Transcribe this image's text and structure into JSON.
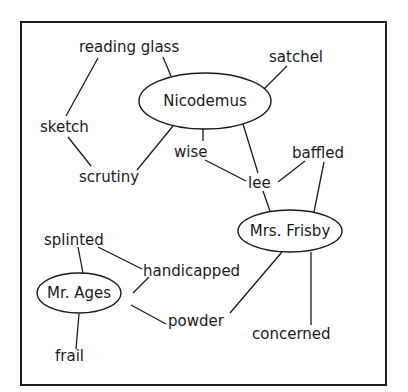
{
  "diagram": {
    "type": "character-word-web",
    "characters": [
      {
        "id": "nicodemus",
        "label": "Nicodemus",
        "cx": 205,
        "cy": 101,
        "rx": 66,
        "ry": 28
      },
      {
        "id": "mrs-frisby",
        "label": "Mrs. Frisby",
        "cx": 290,
        "cy": 231,
        "rx": 52,
        "ry": 21
      },
      {
        "id": "mr-ages",
        "label": "Mr. Ages",
        "cx": 79,
        "cy": 293,
        "rx": 42,
        "ry": 20
      }
    ],
    "words": [
      {
        "id": "reading-glass",
        "label": "reading glass",
        "x": 79,
        "y": 52
      },
      {
        "id": "satchel",
        "label": "satchel",
        "x": 269,
        "y": 62
      },
      {
        "id": "sketch",
        "label": "sketch",
        "x": 40,
        "y": 132
      },
      {
        "id": "scrutiny",
        "label": "scrutiny",
        "x": 79,
        "y": 182
      },
      {
        "id": "wise",
        "label": "wise",
        "x": 174,
        "y": 157
      },
      {
        "id": "lee",
        "label": "lee",
        "x": 248,
        "y": 188
      },
      {
        "id": "baffled",
        "label": "baffled",
        "x": 292,
        "y": 158
      },
      {
        "id": "splinted",
        "label": "splinted",
        "x": 44,
        "y": 245
      },
      {
        "id": "handicapped",
        "label": "handicapped",
        "x": 143,
        "y": 276
      },
      {
        "id": "powder",
        "label": "powder",
        "x": 168,
        "y": 326
      },
      {
        "id": "concerned",
        "label": "concerned",
        "x": 252,
        "y": 339
      },
      {
        "id": "frail",
        "label": "frail",
        "x": 55,
        "y": 361
      }
    ],
    "connections": [
      {
        "from": "reading-glass",
        "to": "sketch",
        "x1": 98,
        "y1": 58,
        "x2": 66,
        "y2": 116
      },
      {
        "from": "reading-glass",
        "to": "nicodemus",
        "x1": 163,
        "y1": 57,
        "x2": 171,
        "y2": 76
      },
      {
        "from": "sketch",
        "to": "scrutiny",
        "x1": 68,
        "y1": 137,
        "x2": 91,
        "y2": 166
      },
      {
        "from": "scrutiny",
        "to": "nicodemus",
        "x1": 137,
        "y1": 170,
        "x2": 173,
        "y2": 126
      },
      {
        "from": "satchel",
        "to": "nicodemus",
        "x1": 287,
        "y1": 66,
        "x2": 264,
        "y2": 89
      },
      {
        "from": "nicodemus",
        "to": "wise",
        "x1": 203,
        "y1": 129,
        "x2": 203,
        "y2": 141
      },
      {
        "from": "nicodemus",
        "to": "lee",
        "x1": 243,
        "y1": 124,
        "x2": 258,
        "y2": 173
      },
      {
        "from": "wise",
        "to": "lee",
        "x1": 205,
        "y1": 160,
        "x2": 246,
        "y2": 181
      },
      {
        "from": "lee",
        "to": "baffled",
        "x1": 278,
        "y1": 182,
        "x2": 305,
        "y2": 161
      },
      {
        "from": "lee",
        "to": "mrs-frisby",
        "x1": 263,
        "y1": 191,
        "x2": 270,
        "y2": 211
      },
      {
        "from": "baffled",
        "to": "mrs-frisby",
        "x1": 324,
        "y1": 162,
        "x2": 314,
        "y2": 212
      },
      {
        "from": "mrs-frisby",
        "to": "powder",
        "x1": 282,
        "y1": 252,
        "x2": 230,
        "y2": 313
      },
      {
        "from": "mrs-frisby",
        "to": "concerned",
        "x1": 311,
        "y1": 252,
        "x2": 311,
        "y2": 325
      },
      {
        "from": "splinted",
        "to": "mr-ages",
        "x1": 78,
        "y1": 247,
        "x2": 83,
        "y2": 273
      },
      {
        "from": "splinted",
        "to": "handicapped",
        "x1": 98,
        "y1": 247,
        "x2": 142,
        "y2": 269
      },
      {
        "from": "handicapped",
        "to": "mr-ages",
        "x1": 149,
        "y1": 277,
        "x2": 133,
        "y2": 293
      },
      {
        "from": "mr-ages",
        "to": "powder",
        "x1": 131,
        "y1": 305,
        "x2": 166,
        "y2": 324
      },
      {
        "from": "mr-ages",
        "to": "frail",
        "x1": 79,
        "y1": 314,
        "x2": 76,
        "y2": 349
      }
    ],
    "frame": {
      "x": 21,
      "y": 22,
      "width": 365,
      "height": 363
    },
    "colors": {
      "ink": "#1a1a1a",
      "background": "#ffffff"
    }
  }
}
